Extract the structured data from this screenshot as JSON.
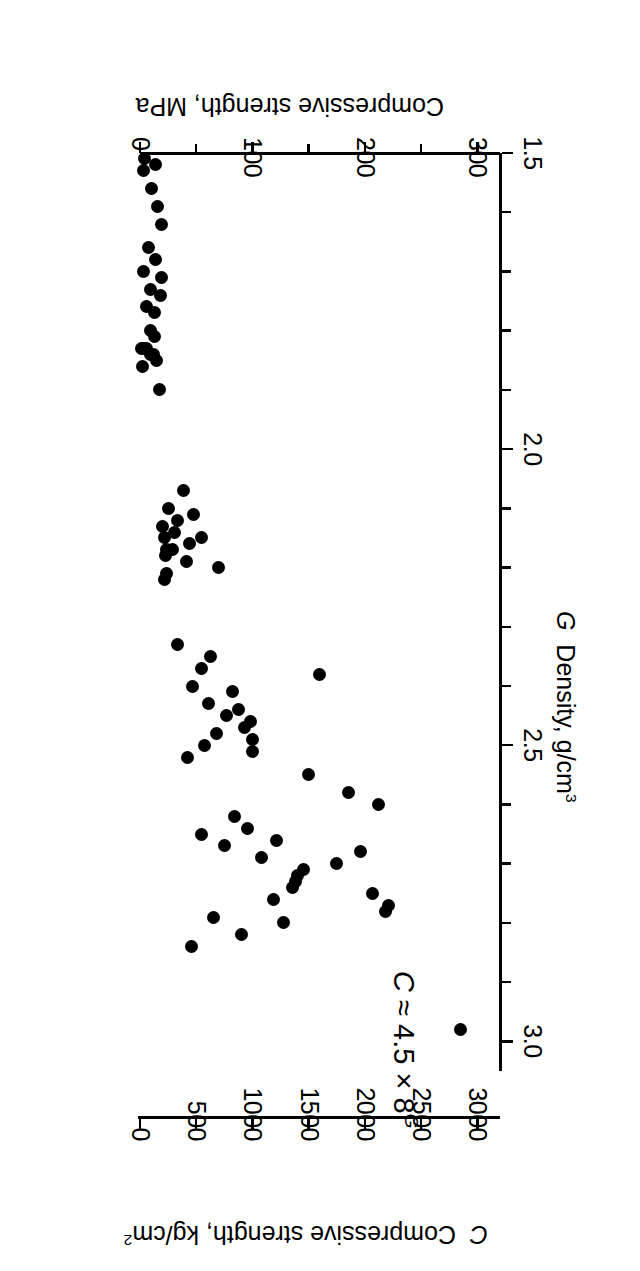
{
  "chart_data": {
    "type": "scatter",
    "title": "",
    "xlabel": "G Density, g/cm3",
    "ylabel": "C Compressive strength, kg/cm2",
    "ylabel_secondary": "Compressive strength, MPa",
    "annotation": "C ≈ 4.5 × 8",
    "annotation_exponent": "G",
    "grid": false,
    "legend": "none",
    "xlim": [
      1.5,
      3.05
    ],
    "ylim_mpa": [
      0,
      320
    ],
    "ylim_kgcm2": [
      0,
      3200
    ],
    "x_ticks": [
      1.5,
      2.0,
      2.5,
      3.0
    ],
    "x_tick_labels": [
      "1.5",
      "2.0",
      "2.5",
      "3.0"
    ],
    "x_minor_step": 0.1,
    "y_ticks_mpa": [
      0,
      100,
      200,
      300
    ],
    "y_tick_labels_mpa": [
      "0",
      "100",
      "200",
      "300"
    ],
    "y_minor_step_mpa": 50,
    "y_ticks_kgcm2": [
      0,
      500,
      1000,
      1500,
      2000,
      2500,
      3000
    ],
    "y_tick_labels_kgcm2": [
      "0",
      "500",
      "1000",
      "1500",
      "2000",
      "2500",
      "3000"
    ],
    "points": [
      {
        "x": 1.51,
        "y_mpa": 4
      },
      {
        "x": 1.52,
        "y_mpa": 14
      },
      {
        "x": 1.53,
        "y_mpa": 3
      },
      {
        "x": 1.56,
        "y_mpa": 10
      },
      {
        "x": 1.59,
        "y_mpa": 16
      },
      {
        "x": 1.62,
        "y_mpa": 19
      },
      {
        "x": 1.66,
        "y_mpa": 8
      },
      {
        "x": 1.68,
        "y_mpa": 14
      },
      {
        "x": 1.7,
        "y_mpa": 3
      },
      {
        "x": 1.71,
        "y_mpa": 19
      },
      {
        "x": 1.73,
        "y_mpa": 9
      },
      {
        "x": 1.74,
        "y_mpa": 18
      },
      {
        "x": 1.76,
        "y_mpa": 6
      },
      {
        "x": 1.77,
        "y_mpa": 13
      },
      {
        "x": 1.8,
        "y_mpa": 9
      },
      {
        "x": 1.81,
        "y_mpa": 13
      },
      {
        "x": 1.83,
        "y_mpa": 1
      },
      {
        "x": 1.83,
        "y_mpa": 3
      },
      {
        "x": 1.83,
        "y_mpa": 6
      },
      {
        "x": 1.84,
        "y_mpa": 9
      },
      {
        "x": 1.84,
        "y_mpa": 12
      },
      {
        "x": 1.85,
        "y_mpa": 15
      },
      {
        "x": 1.86,
        "y_mpa": 2
      },
      {
        "x": 1.9,
        "y_mpa": 17
      },
      {
        "x": 2.07,
        "y_mpa": 39
      },
      {
        "x": 2.1,
        "y_mpa": 25
      },
      {
        "x": 2.11,
        "y_mpa": 48
      },
      {
        "x": 2.12,
        "y_mpa": 33
      },
      {
        "x": 2.13,
        "y_mpa": 20
      },
      {
        "x": 2.14,
        "y_mpa": 31
      },
      {
        "x": 2.15,
        "y_mpa": 55
      },
      {
        "x": 2.15,
        "y_mpa": 22
      },
      {
        "x": 2.16,
        "y_mpa": 44
      },
      {
        "x": 2.17,
        "y_mpa": 29
      },
      {
        "x": 2.17,
        "y_mpa": 24
      },
      {
        "x": 2.18,
        "y_mpa": 23
      },
      {
        "x": 2.19,
        "y_mpa": 41
      },
      {
        "x": 2.2,
        "y_mpa": 70
      },
      {
        "x": 2.21,
        "y_mpa": 24
      },
      {
        "x": 2.22,
        "y_mpa": 22
      },
      {
        "x": 2.33,
        "y_mpa": 33
      },
      {
        "x": 2.35,
        "y_mpa": 63
      },
      {
        "x": 2.37,
        "y_mpa": 55
      },
      {
        "x": 2.38,
        "y_mpa": 160
      },
      {
        "x": 2.4,
        "y_mpa": 47
      },
      {
        "x": 2.41,
        "y_mpa": 82
      },
      {
        "x": 2.43,
        "y_mpa": 61
      },
      {
        "x": 2.44,
        "y_mpa": 88
      },
      {
        "x": 2.45,
        "y_mpa": 77
      },
      {
        "x": 2.46,
        "y_mpa": 98
      },
      {
        "x": 2.47,
        "y_mpa": 93
      },
      {
        "x": 2.48,
        "y_mpa": 68
      },
      {
        "x": 2.49,
        "y_mpa": 100
      },
      {
        "x": 2.5,
        "y_mpa": 57
      },
      {
        "x": 2.51,
        "y_mpa": 100
      },
      {
        "x": 2.52,
        "y_mpa": 42
      },
      {
        "x": 2.55,
        "y_mpa": 150
      },
      {
        "x": 2.58,
        "y_mpa": 185
      },
      {
        "x": 2.6,
        "y_mpa": 212
      },
      {
        "x": 2.62,
        "y_mpa": 84
      },
      {
        "x": 2.64,
        "y_mpa": 96
      },
      {
        "x": 2.65,
        "y_mpa": 55
      },
      {
        "x": 2.66,
        "y_mpa": 121
      },
      {
        "x": 2.67,
        "y_mpa": 75
      },
      {
        "x": 2.68,
        "y_mpa": 196
      },
      {
        "x": 2.69,
        "y_mpa": 108
      },
      {
        "x": 2.7,
        "y_mpa": 175
      },
      {
        "x": 2.71,
        "y_mpa": 145
      },
      {
        "x": 2.72,
        "y_mpa": 140
      },
      {
        "x": 2.73,
        "y_mpa": 138
      },
      {
        "x": 2.74,
        "y_mpa": 136
      },
      {
        "x": 2.75,
        "y_mpa": 207
      },
      {
        "x": 2.76,
        "y_mpa": 119
      },
      {
        "x": 2.77,
        "y_mpa": 221
      },
      {
        "x": 2.78,
        "y_mpa": 218
      },
      {
        "x": 2.79,
        "y_mpa": 65
      },
      {
        "x": 2.8,
        "y_mpa": 128
      },
      {
        "x": 2.82,
        "y_mpa": 90
      },
      {
        "x": 2.84,
        "y_mpa": 46
      },
      {
        "x": 2.98,
        "y_mpa": 285
      }
    ]
  },
  "axes": {
    "strength_mpa": {
      "title": "Compressive strength, MPa",
      "labels": [
        "0",
        "100",
        "200",
        "300"
      ]
    },
    "strength_kgcm2": {
      "title_prefix": "C",
      "title": "Compressive strength, kg/cm",
      "title_sup": "2",
      "labels": [
        "0",
        "500",
        "1000",
        "1500",
        "2000",
        "2500",
        "3000"
      ]
    },
    "density": {
      "title_prefix": "G",
      "title": "Density, g/cm",
      "title_sup": "3",
      "labels": [
        "1.5",
        "2.0",
        "2.5",
        "3.0"
      ]
    }
  },
  "annotation": {
    "lead": "C",
    "approx": "≈",
    "value": "4.5",
    "times": "×",
    "base": "8",
    "exponent": "G"
  },
  "colors": {
    "ink": "#000000",
    "paper": "#ffffff"
  }
}
